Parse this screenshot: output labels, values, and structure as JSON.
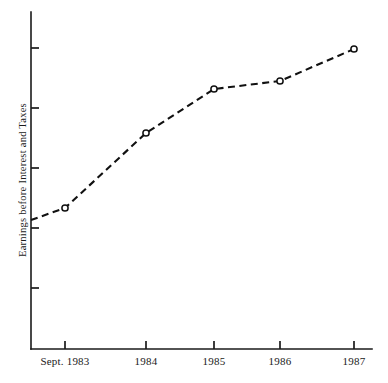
{
  "chart_data": {
    "type": "line",
    "title": "",
    "subtitle": "",
    "xlabel": "",
    "ylabel": "Earnings before Interest and Taxes",
    "categories": [
      "Sept. 1983",
      "1984",
      "1985",
      "1986",
      "1987"
    ],
    "x_tick_labels": [
      "Sept. 1983",
      "1984",
      "1985",
      "1986",
      "1987"
    ],
    "y_tick_labels": [
      "",
      "",
      "",
      "",
      ""
    ],
    "y_axis_labeled": false,
    "grid": false,
    "legend": false,
    "legend_position": "none",
    "marker": "open-circle",
    "line_style": "dashed",
    "line_color": "#111111",
    "series": [
      {
        "name": "Earnings before Interest and Taxes",
        "values": [
          2.2,
          4.65,
          6.65,
          6.95,
          8.3
        ]
      }
    ],
    "x_pixels": [
      65,
      146,
      214,
      280,
      354
    ],
    "y_pixels": [
      208,
      133,
      89,
      81,
      49
    ],
    "y_tick_pixels": [
      48,
      108,
      168,
      228,
      288
    ],
    "axis_origin_pixel": [
      31,
      349
    ],
    "axis_top_pixel": 12,
    "axis_right_pixel": 372,
    "lead_in_point_pixel": [
      31,
      220
    ],
    "ylim": [
      0,
      10
    ]
  },
  "axes": {
    "y_label_text": "Earnings before Interest and Taxes",
    "x_tick_0": "Sept. 1983",
    "x_tick_1": "1984",
    "x_tick_2": "1985",
    "x_tick_3": "1986",
    "x_tick_4": "1987"
  }
}
